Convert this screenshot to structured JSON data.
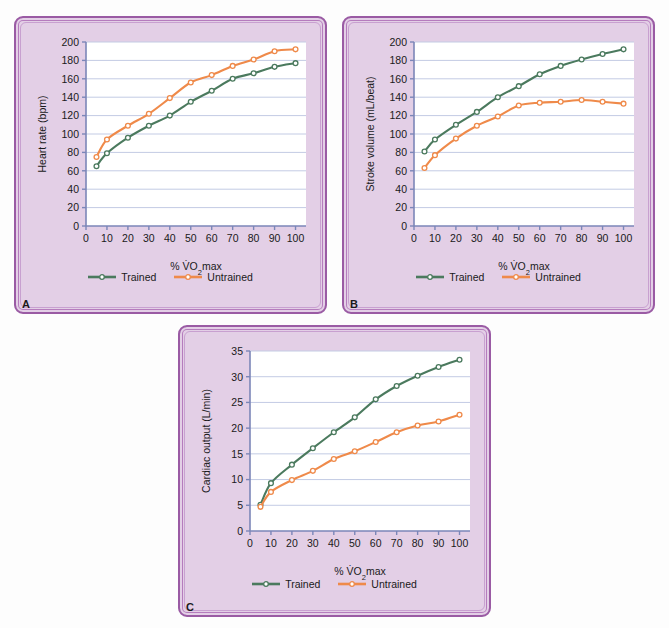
{
  "figure": {
    "series_names": [
      "Trained",
      "Untrained"
    ],
    "colors": {
      "trained": "#4b7a5e",
      "untrained": "#ef8a4a",
      "axis": "#7b86b8",
      "grid": "#c3cbe4",
      "panel_bg": "#e3cfe6",
      "panel_border": "#9a5ba4",
      "plot_bg": "#ffffff"
    },
    "xlabel": "% V̇O₂max",
    "legend": {
      "trained_label": "Trained",
      "untrained_label": "Untrained"
    }
  },
  "panels": [
    {
      "id": "A",
      "label": "A"
    },
    {
      "id": "B",
      "label": "B"
    },
    {
      "id": "C",
      "label": "C"
    }
  ],
  "chart_data": [
    {
      "panel": "A",
      "type": "line",
      "title": "",
      "xlabel": "% V̇O₂max",
      "ylabel": "Heart rate (bpm)",
      "x": [
        5,
        10,
        20,
        30,
        40,
        50,
        60,
        70,
        80,
        90,
        100
      ],
      "xlim": [
        0,
        105
      ],
      "ylim": [
        0,
        200
      ],
      "xticks": [
        0,
        10,
        20,
        30,
        40,
        50,
        60,
        70,
        80,
        90,
        100
      ],
      "yticks": [
        0,
        20,
        40,
        60,
        80,
        100,
        120,
        140,
        160,
        180,
        200
      ],
      "grid": "horizontal",
      "legend_position": "bottom",
      "series": [
        {
          "name": "Trained",
          "color": "#4b7a5e",
          "values": [
            65,
            79,
            96,
            109,
            120,
            135,
            147,
            160,
            166,
            173,
            177
          ]
        },
        {
          "name": "Untrained",
          "color": "#ef8a4a",
          "values": [
            75,
            94,
            109,
            122,
            139,
            156,
            164,
            174,
            181,
            190,
            192
          ]
        }
      ]
    },
    {
      "panel": "B",
      "type": "line",
      "title": "",
      "xlabel": "% V̇O₂max",
      "ylabel": "Stroke volume (mL/beat)",
      "x": [
        5,
        10,
        20,
        30,
        40,
        50,
        60,
        70,
        80,
        90,
        100
      ],
      "xlim": [
        0,
        105
      ],
      "ylim": [
        0,
        200
      ],
      "xticks": [
        0,
        10,
        20,
        30,
        40,
        50,
        60,
        70,
        80,
        90,
        100
      ],
      "yticks": [
        0,
        20,
        40,
        60,
        80,
        100,
        120,
        140,
        160,
        180,
        200
      ],
      "grid": "horizontal",
      "legend_position": "bottom",
      "series": [
        {
          "name": "Trained",
          "color": "#4b7a5e",
          "values": [
            81,
            94,
            110,
            124,
            140,
            152,
            165,
            174,
            181,
            187,
            192
          ]
        },
        {
          "name": "Untrained",
          "color": "#ef8a4a",
          "values": [
            63,
            77,
            95,
            109,
            119,
            131,
            134,
            135,
            137,
            135,
            133
          ]
        }
      ]
    },
    {
      "panel": "C",
      "type": "line",
      "title": "",
      "xlabel": "% V̇O₂max",
      "ylabel": "Cardiac output (L/min)",
      "x": [
        5,
        10,
        20,
        30,
        40,
        50,
        60,
        70,
        80,
        90,
        100
      ],
      "xlim": [
        0,
        105
      ],
      "ylim": [
        0,
        35
      ],
      "xticks": [
        0,
        10,
        20,
        30,
        40,
        50,
        60,
        70,
        80,
        90,
        100
      ],
      "yticks": [
        0,
        5,
        10,
        15,
        20,
        25,
        30,
        35
      ],
      "grid": "horizontal",
      "legend_position": "bottom",
      "series": [
        {
          "name": "Trained",
          "color": "#4b7a5e",
          "values": [
            5.1,
            9.3,
            12.9,
            16.1,
            19.2,
            22.1,
            25.6,
            28.2,
            30.2,
            31.9,
            33.3
          ]
        },
        {
          "name": "Untrained",
          "color": "#ef8a4a",
          "values": [
            4.7,
            7.6,
            9.9,
            11.7,
            14.0,
            15.5,
            17.3,
            19.2,
            20.5,
            21.3,
            22.6
          ]
        }
      ]
    }
  ]
}
